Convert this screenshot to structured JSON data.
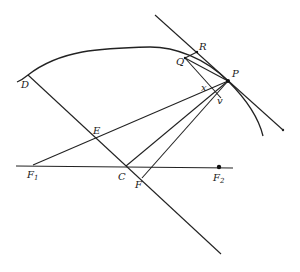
{
  "diagram": {
    "type": "geometry",
    "labels": {
      "D": "D",
      "E": "E",
      "F1": "F",
      "F1_sub": "1",
      "C": "C",
      "F": "F",
      "F2": "F",
      "F2_sub": "2",
      "Q": "Q",
      "R": "R",
      "P": "P",
      "x": "x",
      "v": "v"
    },
    "points": {
      "D": [
        28,
        75
      ],
      "E": [
        93,
        135
      ],
      "F1": [
        33,
        165
      ],
      "C": [
        126,
        166
      ],
      "F": [
        142,
        178
      ],
      "F2": [
        219,
        167
      ],
      "Q": [
        185,
        58
      ],
      "R": [
        197,
        52
      ],
      "P": [
        228,
        81
      ],
      "x": [
        206,
        88
      ],
      "v": [
        220,
        95
      ]
    },
    "colors": {
      "stroke": "#222222",
      "background": "#ffffff"
    }
  }
}
